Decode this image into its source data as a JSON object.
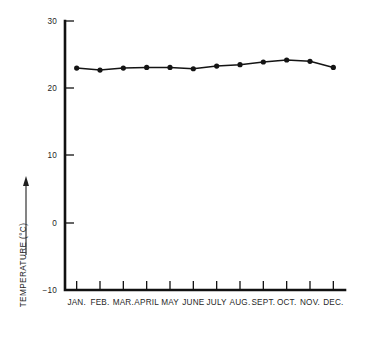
{
  "chart_data": {
    "type": "line",
    "title": "",
    "subtitle": "",
    "xlabel": "",
    "ylabel": "TEMPERATURE (°C)",
    "ylabel_arrow": "⟶",
    "categories": [
      "JAN.",
      "FEB.",
      "MAR.",
      "APRIL",
      "MAY",
      "JUNE",
      "JULY",
      "AUG.",
      "SEPT.",
      "OCT.",
      "NOV.",
      "DEC."
    ],
    "values": [
      23.0,
      22.7,
      23.0,
      23.1,
      23.1,
      22.9,
      23.3,
      23.5,
      23.9,
      24.2,
      24.0,
      23.1
    ],
    "ylim": [
      -10,
      30
    ],
    "yticks": [
      30,
      20,
      10,
      0,
      -10
    ],
    "ytick_labels": [
      "30",
      "20",
      "10",
      "0",
      "−10"
    ],
    "grid": false,
    "legend": false,
    "legend_position": "none",
    "marker": "filled-circle",
    "line_color": "#141414",
    "marker_color": "#141414",
    "axis_color": "#111111",
    "background_color": "#ffffff"
  },
  "figure": {
    "plot_left": 65,
    "plot_right": 345,
    "plot_top": 21,
    "plot_bottom": 290
  },
  "icons": {
    "up_arrow": "up-arrow-icon"
  }
}
